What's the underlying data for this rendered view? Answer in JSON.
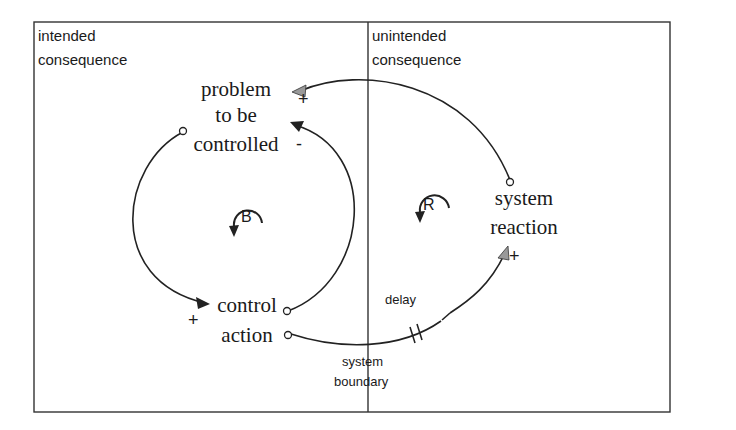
{
  "regions": {
    "left": {
      "label_line1": "intended",
      "label_line2": "consequence"
    },
    "right": {
      "label_line1": "unintended",
      "label_line2": "consequence"
    },
    "boundary": {
      "label_line1": "system",
      "label_line2": "boundary"
    }
  },
  "variables": {
    "problem": {
      "line1": "problem",
      "line2": "to be",
      "line3": "controlled"
    },
    "control": {
      "line1": "control",
      "line2": "action"
    },
    "reaction": {
      "line1": "system",
      "line2": "reaction"
    }
  },
  "links": {
    "reaction_to_problem_polarity": "+",
    "control_to_problem_polarity": "-",
    "problem_to_control_polarity": "+",
    "control_to_reaction_polarity": "+",
    "delay_label": "delay"
  },
  "loops": {
    "balancing": "B",
    "reinforcing": "R"
  },
  "colors": {
    "line": "#222222",
    "gray_arrow": "#999999"
  }
}
